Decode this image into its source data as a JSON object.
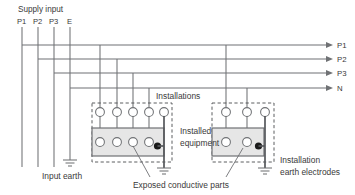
{
  "diagram": {
    "supply": {
      "heading": "Supply input",
      "terminals": [
        "P1",
        "P2",
        "P3",
        "E"
      ]
    },
    "outputs": {
      "labels": [
        "P1",
        "P2",
        "P3",
        "N"
      ]
    },
    "annotations": {
      "installations": "Installations",
      "installed_equipment_line1": "Installed",
      "installed_equipment_line2": "equipment",
      "input_earth": "Input earth",
      "exposed_conductive_parts": "Exposed conductive parts",
      "installation_earth_line1": "Installation",
      "installation_earth_line2": "earth electrodes"
    },
    "colors": {
      "wire": "#6f7174",
      "wire_bold": "#55585b",
      "text": "#3a3a3a",
      "equipment_fill": "#e6e6e6",
      "node_dot": "#1a1a1a",
      "dashed_border": "#4a4c4e",
      "background": "#ffffff"
    },
    "installation_left": {
      "top_terminal_count": 5,
      "bottom_terminal_count": 4
    },
    "installation_right": {
      "top_terminal_count": 3,
      "bottom_terminal_count": 2
    }
  }
}
